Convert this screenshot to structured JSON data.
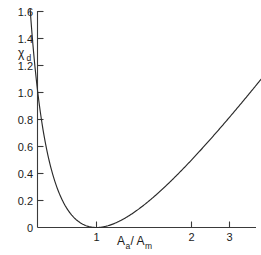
{
  "chart_data": {
    "type": "line",
    "title": "",
    "subtitle": "",
    "xlabel": "A_a/A_m",
    "xlabel_parts": {
      "main1": "A",
      "sub1": "a",
      "slash": "/",
      "main2": "A",
      "sub2": "m"
    },
    "ylabel": "χ_d",
    "ylabel_parts": {
      "main": "χ",
      "sub": "d"
    },
    "xlim": [
      0,
      3.45
    ],
    "ylim": [
      0,
      1.62
    ],
    "xticks": [
      1,
      2,
      3
    ],
    "xtick_labels": [
      "1",
      "2",
      "3"
    ],
    "yticks": [
      0,
      0.2,
      0.4,
      0.6,
      0.8,
      1.0,
      1.2,
      1.4,
      1.6
    ],
    "ytick_labels": [
      "0",
      "0.2",
      "0.4",
      "0.6",
      "0.8",
      "1.0",
      "1.2",
      "1.4",
      "1.6"
    ],
    "grid": false,
    "legend": null,
    "legend_position": "none",
    "series": [
      {
        "name": "chi_d",
        "formula": "(sqrt(x) - 1/sqrt(x))^2 = x + 1/x - 2",
        "x": [
          0.182,
          0.2,
          0.22,
          0.25,
          0.28,
          0.32,
          0.36,
          0.4,
          0.45,
          0.5,
          0.55,
          0.6,
          0.65,
          0.7,
          0.75,
          0.8,
          0.85,
          0.9,
          0.95,
          1.0,
          1.05,
          1.1,
          1.2,
          1.3,
          1.4,
          1.5,
          1.6,
          1.7,
          1.8,
          1.9,
          2.0,
          2.1,
          2.2,
          2.3,
          2.4,
          2.5,
          2.6,
          2.7,
          2.8,
          2.9,
          3.0,
          3.05
        ],
        "y": [
          1.6,
          1.2,
          0.965,
          0.75,
          0.57,
          0.405,
          0.3,
          0.9,
          0.0,
          0.0,
          0.0,
          0.0,
          0.0,
          0.0,
          0.0,
          0.0,
          0.0,
          0.0,
          0.0,
          0.0,
          0.0,
          0.0,
          0.0,
          0.0,
          0.0,
          0.0,
          0.0,
          0.0,
          0.0,
          0.0,
          0.5,
          0.0,
          0.0,
          0.0,
          0.0,
          0.0,
          0.0,
          0.0,
          0.0,
          0.0,
          1.33,
          1.4
        ]
      }
    ],
    "minimum": {
      "x": 1.0,
      "y": 0.0
    }
  },
  "axes": {
    "x_axis_name": "horizontal-axis",
    "y_axis_name": "vertical-axis"
  }
}
